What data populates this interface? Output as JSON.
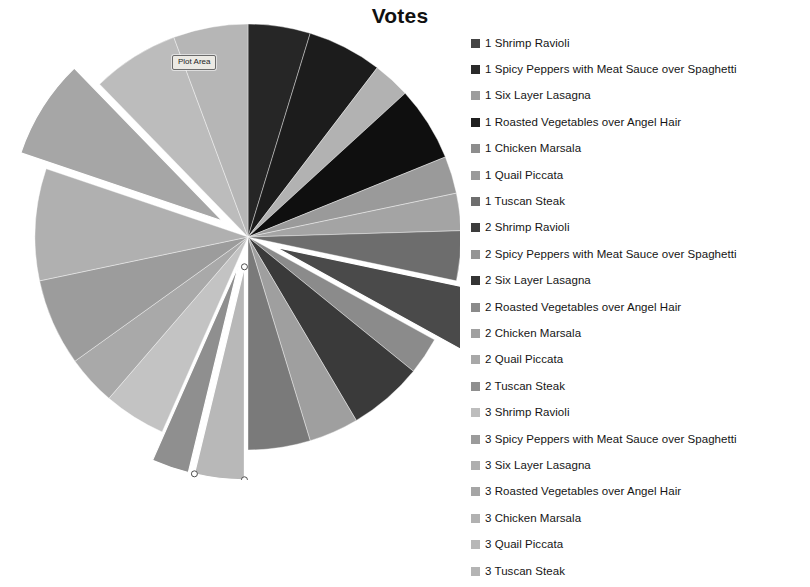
{
  "chart": {
    "title": "Votes",
    "plot_area_tooltip": "Plot Area",
    "background_color": "#ffffff",
    "title_color": "#111111"
  },
  "chart_data": {
    "type": "pie",
    "title": "Votes",
    "xlabel": "",
    "ylabel": "",
    "legend_position": "right",
    "grid": false,
    "start_angle_deg": 0,
    "categories": [
      "1 Shrimp Ravioli",
      "1 Spicy Peppers with Meat Sauce over Spaghetti",
      "1 Six Layer Lasagna",
      "1 Roasted Vegetables over Angel Hair",
      "1 Chicken Marsala",
      "1 Quail Piccata",
      "1 Tuscan Steak",
      "2 Shrimp Ravioli",
      "2 Spicy Peppers with Meat Sauce over Spaghetti",
      "2 Six Layer Lasagna",
      "2 Roasted Vegetables over Angel Hair",
      "2 Chicken Marsala",
      "2 Quail Piccata",
      "2 Tuscan Steak",
      "3 Shrimp Ravioli",
      "3 Spicy Peppers with Meat Sauce over Spaghetti",
      "3 Six Layer Lasagna",
      "3 Roasted Vegetables over Angel Hair",
      "3 Chicken Marsala",
      "3 Quail Piccata",
      "3 Tuscan Steak"
    ],
    "values": [
      5,
      6,
      3,
      6,
      3,
      3,
      4,
      5,
      3,
      6,
      4,
      5,
      4,
      3,
      5,
      4,
      7,
      9,
      8,
      7,
      6
    ],
    "colors": [
      "#262626",
      "#1c1c1c",
      "#b2b2b2",
      "#0f0f0f",
      "#9a9a9a",
      "#a4a4a4",
      "#6d6d6d",
      "#4a4a4a",
      "#8b8b8b",
      "#3a3a3a",
      "#9f9f9f",
      "#7a7a7a",
      "#b8b8b8",
      "#8f8f8f",
      "#c3c3c3",
      "#a9a9a9",
      "#9c9c9c",
      "#b0b0b0",
      "#a6a6a6",
      "#bcbcbc",
      "#b6b6b6"
    ],
    "exploded": [
      false,
      false,
      false,
      false,
      false,
      false,
      false,
      true,
      false,
      false,
      false,
      false,
      true,
      true,
      false,
      false,
      false,
      false,
      true,
      false,
      false
    ],
    "selected_slice": "2 Quail Piccata"
  },
  "legend": {
    "items": [
      {
        "label": "1 Shrimp Ravioli",
        "color": "#444444"
      },
      {
        "label": "1 Spicy Peppers with Meat Sauce over Spaghetti",
        "color": "#2b2b2b"
      },
      {
        "label": "1 Six Layer Lasagna",
        "color": "#9d9d9d"
      },
      {
        "label": "1 Roasted Vegetables over Angel Hair",
        "color": "#1f1f1f"
      },
      {
        "label": "1 Chicken Marsala",
        "color": "#8d8d8d"
      },
      {
        "label": "1 Quail Piccata",
        "color": "#9a9a9a"
      },
      {
        "label": "1 Tuscan Steak",
        "color": "#6e6e6e"
      },
      {
        "label": "2 Shrimp Ravioli",
        "color": "#3c3c3c"
      },
      {
        "label": "2 Spicy Peppers with Meat Sauce over Spaghetti",
        "color": "#959595"
      },
      {
        "label": "2 Six Layer Lasagna",
        "color": "#343434"
      },
      {
        "label": "2 Roasted Vegetables over Angel Hair",
        "color": "#8a8a8a"
      },
      {
        "label": "2 Chicken Marsala",
        "color": "#a0a0a0"
      },
      {
        "label": "2 Quail Piccata",
        "color": "#a8a8a8"
      },
      {
        "label": "2 Tuscan Steak",
        "color": "#8f8f8f"
      },
      {
        "label": "3 Shrimp Ravioli",
        "color": "#bdbdbd"
      },
      {
        "label": "3 Spicy Peppers with Meat Sauce over Spaghetti",
        "color": "#9b9b9b"
      },
      {
        "label": "3 Six Layer Lasagna",
        "color": "#aeaeae"
      },
      {
        "label": "3 Roasted Vegetables over Angel Hair",
        "color": "#a5a5a5"
      },
      {
        "label": "3 Chicken Marsala",
        "color": "#b1b1b1"
      },
      {
        "label": "3 Quail Piccata",
        "color": "#b7b7b7"
      },
      {
        "label": "3 Tuscan Steak",
        "color": "#b4b4b4"
      }
    ]
  }
}
